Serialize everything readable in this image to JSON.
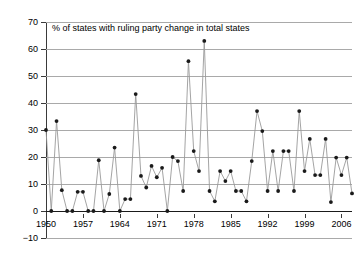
{
  "chart_data": {
    "type": "line",
    "title": "% of states with ruling party change in total states",
    "xlabel": "",
    "ylabel": "",
    "ylim": [
      -10,
      70
    ],
    "xlim": [
      1950,
      2008
    ],
    "yticks": [
      70,
      60,
      50,
      40,
      30,
      20,
      10,
      0,
      -10
    ],
    "xticks": [
      1950,
      1957,
      1964,
      1971,
      1978,
      1985,
      1992,
      1999,
      2006
    ],
    "grid": true,
    "legend": "none",
    "markers": "filled-circle",
    "marker_color": "#1a1a1a",
    "line_color": "#9a9a9a",
    "grid_color": "#a9a9a9",
    "x": [
      1950,
      1951,
      1952,
      1953,
      1954,
      1955,
      1956,
      1957,
      1958,
      1959,
      1960,
      1961,
      1962,
      1963,
      1964,
      1965,
      1966,
      1967,
      1968,
      1969,
      1970,
      1971,
      1972,
      1973,
      1974,
      1975,
      1976,
      1977,
      1978,
      1979,
      1980,
      1981,
      1982,
      1983,
      1984,
      1985,
      1986,
      1987,
      1988,
      1989,
      1990,
      1991,
      1992,
      1993,
      1994,
      1995,
      1996,
      1997,
      1998,
      1999,
      2000,
      2001,
      2002,
      2003,
      2004,
      2005,
      2006,
      2007,
      2008
    ],
    "values": [
      30,
      0,
      33.3,
      7.7,
      0,
      0,
      7.1,
      7.1,
      0,
      0,
      18.8,
      0,
      6.3,
      23.5,
      0,
      4.4,
      4.4,
      43.3,
      13,
      8.7,
      16.7,
      12.5,
      16,
      0,
      20,
      18.5,
      7.4,
      55.5,
      22.2,
      14.8,
      63,
      7.4,
      3.6,
      14.8,
      11.1,
      14.8,
      7.4,
      7.4,
      3.6,
      18.5,
      37,
      29.6,
      7.4,
      22.2,
      7.4,
      22.2,
      22.2,
      7.4,
      37,
      14.8,
      26.7,
      13.3,
      13.3,
      26.7,
      3.3,
      19.8,
      13.3,
      19.8,
      6.5
    ]
  },
  "axis": {
    "y_labels": [
      "70",
      "60",
      "50",
      "40",
      "30",
      "20",
      "10",
      "0",
      "-10"
    ],
    "x_labels": [
      "1950",
      "1957",
      "1964",
      "1971",
      "1978",
      "1985",
      "1992",
      "1999",
      "2006"
    ]
  }
}
